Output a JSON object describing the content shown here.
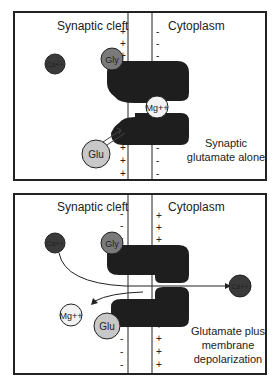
{
  "panels": [
    {
      "id": "top",
      "left_label": "Synaptic cleft",
      "right_label": "Cytoplasm",
      "caption_line1": "Synaptic",
      "caption_line2": "glutamate alone",
      "left_charge": "+",
      "right_charge": "-",
      "ions": {
        "ca": "Ca++",
        "gly": "Gly",
        "mg": "Mg++",
        "glu": "Glu"
      }
    },
    {
      "id": "bottom",
      "left_label": "Synaptic cleft",
      "right_label": "Cytoplasm",
      "caption_line1": "Glutamate plus",
      "caption_line2": "membrane",
      "caption_line3": "depolarization",
      "left_charge": "-",
      "right_charge": "+",
      "ions": {
        "ca_out": "Ca++",
        "ca_in": "Ca++",
        "gly": "Gly",
        "mg": "Mg++",
        "glu": "Glu"
      }
    }
  ],
  "colors": {
    "receptor": "#1e1e1e",
    "ion_dark": "#3a3a3a",
    "ion_gray": "#8a8a8a",
    "ion_light": "#c8c8c8",
    "ion_white": "#f2f2f2",
    "border": "#222222"
  }
}
